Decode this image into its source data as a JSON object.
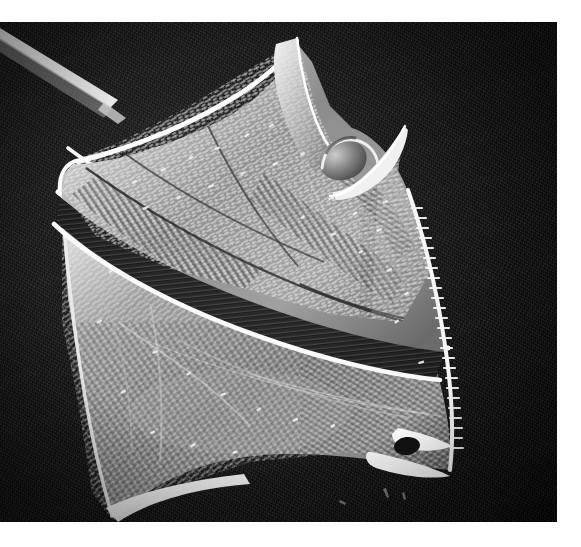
{
  "figure": {
    "kind": "sem-micrograph",
    "modality": "Scanning electron microscope",
    "orientation": "oblique ventral-lateral view",
    "background_color": "#0a0a0a",
    "page_color": "#ffffff",
    "specimen_highlight_color": "#f4f4f4",
    "specimen_midtone_color": "#9a9a9a",
    "specimen_shadow_color": "#2a2a2a",
    "caption": "",
    "scale_bar": "",
    "annotations": []
  },
  "plate": {
    "x": 0,
    "y": 22,
    "width": 557,
    "height": 500,
    "margin_top": 22,
    "margin_right": 24,
    "margin_bottom": 25,
    "margin_left": 0
  },
  "features": [
    {
      "id": "apical-horn",
      "label": "apical horn",
      "x": 300,
      "y": 40
    },
    {
      "id": "accessory-spine",
      "label": "accessory spine",
      "x": 400,
      "y": 115
    },
    {
      "id": "dome-pore-plate",
      "label": "dome / pore plate",
      "x": 345,
      "y": 135
    },
    {
      "id": "epitheca",
      "label": "epitheca",
      "x": 230,
      "y": 180
    },
    {
      "id": "cingulum-groove",
      "label": "cingulum groove",
      "x": 220,
      "y": 300
    },
    {
      "id": "cingular-list",
      "label": "cingular list",
      "x": 200,
      "y": 265
    },
    {
      "id": "hypotheca",
      "label": "hypotheca",
      "x": 230,
      "y": 390
    },
    {
      "id": "reticulate-surface",
      "label": "reticulate thecal plates",
      "x": 280,
      "y": 250
    },
    {
      "id": "antapical-tip",
      "label": "antapical tip",
      "x": 120,
      "y": 495
    },
    {
      "id": "posterior-spine",
      "label": "posterior spine",
      "x": 430,
      "y": 430
    },
    {
      "id": "probe-streak",
      "label": "probe / fibre streak",
      "x": 40,
      "y": 35
    }
  ],
  "texture": {
    "pore_count": 430,
    "ridge_count": 26,
    "stria_count": 58
  }
}
